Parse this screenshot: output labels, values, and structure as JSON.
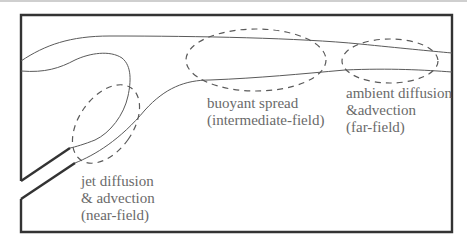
{
  "diagram": {
    "title": "",
    "colors": {
      "border": "#333333",
      "plume_line": "#5a5a5a",
      "dashed_region": "#5a5a5a",
      "text": "#6a6a6a"
    },
    "regions": [
      {
        "id": "near-field",
        "lines": [
          "jet diffusion",
          "& advection",
          "(near-field)"
        ]
      },
      {
        "id": "intermediate-field",
        "lines": [
          "buoyant spread",
          "(intermediate-field)"
        ]
      },
      {
        "id": "far-field",
        "lines": [
          "ambient diffusion",
          "&advection",
          "(far-field)"
        ]
      }
    ]
  }
}
